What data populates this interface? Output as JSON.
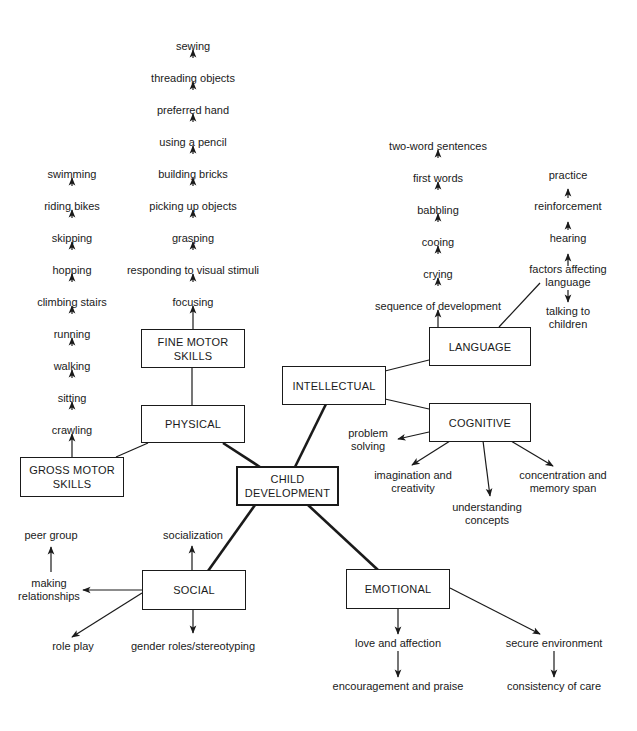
{
  "diagram": {
    "center": {
      "line1": "CHILD",
      "line2": "DEVELOPMENT"
    },
    "domains": {
      "physical": "PHYSICAL",
      "intellectual": "INTELLECTUAL",
      "social": "SOCIAL",
      "emotional": "EMOTIONAL"
    },
    "subdomains": {
      "fine_motor": {
        "line1": "FINE MOTOR",
        "line2": "SKILLS"
      },
      "gross_motor": {
        "line1": "GROSS MOTOR",
        "line2": "SKILLS"
      },
      "language": "LANGUAGE",
      "cognitive": "COGNITIVE"
    },
    "fine_motor_sequence": [
      "focusing",
      "responding to visual stimuli",
      "grasping",
      "picking up objects",
      "building bricks",
      "using a pencil",
      "preferred hand",
      "threading objects",
      "sewing"
    ],
    "gross_motor_sequence": [
      "crawling",
      "sitting",
      "walking",
      "running",
      "climbing stairs",
      "hopping",
      "skipping",
      "riding bikes",
      "swimming"
    ],
    "language_sequence": [
      "sequence of development",
      "crying",
      "cooing",
      "babbling",
      "first words",
      "two-word sentences"
    ],
    "language_factors": {
      "title_line1": "factors affecting",
      "title_line2": "language",
      "up": [
        "hearing",
        "reinforcement",
        "practice"
      ],
      "down_line1": "talking to",
      "down_line2": "children"
    },
    "cognitive_items": {
      "problem_solving": {
        "line1": "problem",
        "line2": "solving"
      },
      "imagination": {
        "line1": "imagination and",
        "line2": "creativity"
      },
      "understanding": {
        "line1": "understanding",
        "line2": "concepts"
      },
      "concentration": {
        "line1": "concentration and",
        "line2": "memory span"
      }
    },
    "social_items": {
      "socialization": "socialization",
      "making_relationships": {
        "line1": "making",
        "line2": "relationships"
      },
      "peer_group": "peer group",
      "role_play": "role play",
      "gender_roles": "gender roles/stereotyping"
    },
    "emotional_items": {
      "love": "love and affection",
      "encouragement": "encouragement and praise",
      "secure": "secure environment",
      "consistency": "consistency of care"
    }
  }
}
